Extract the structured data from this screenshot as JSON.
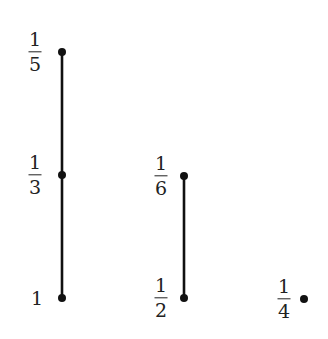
{
  "diagram": {
    "type": "hasse",
    "nodes": [
      {
        "id": "n1",
        "label": {
          "num": "1",
          "den": "5"
        },
        "x": 62,
        "y": 52,
        "lx": 35,
        "ly": 52
      },
      {
        "id": "n2",
        "label": {
          "num": "1",
          "den": "3"
        },
        "x": 62,
        "y": 175,
        "lx": 35,
        "ly": 175
      },
      {
        "id": "n3",
        "label": {
          "whole": "1"
        },
        "x": 62,
        "y": 298,
        "lx": 37,
        "ly": 298
      },
      {
        "id": "n4",
        "label": {
          "num": "1",
          "den": "6"
        },
        "x": 184,
        "y": 176,
        "lx": 161,
        "ly": 176
      },
      {
        "id": "n5",
        "label": {
          "num": "1",
          "den": "2"
        },
        "x": 184,
        "y": 298,
        "lx": 161,
        "ly": 298
      },
      {
        "id": "n6",
        "label": {
          "num": "1",
          "den": "4"
        },
        "x": 304,
        "y": 299,
        "lx": 284,
        "ly": 299
      }
    ],
    "edges": [
      {
        "from": "n3",
        "to": "n2"
      },
      {
        "from": "n2",
        "to": "n1"
      },
      {
        "from": "n5",
        "to": "n4"
      }
    ],
    "colors": {
      "line": "#111111",
      "node": "#111111",
      "text": "#222222"
    }
  }
}
